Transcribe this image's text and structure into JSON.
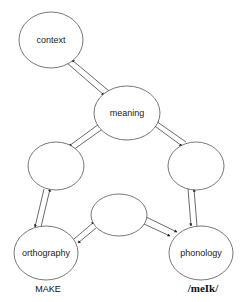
{
  "diagram": {
    "type": "triangle-model-network",
    "nodes": [
      {
        "id": "context",
        "label": "context",
        "cx": 51,
        "cy": 40,
        "rx": 32,
        "ry": 28
      },
      {
        "id": "meaning",
        "label": "meaning",
        "cx": 127,
        "cy": 113,
        "rx": 33,
        "ry": 27
      },
      {
        "id": "hidden_left",
        "label": "",
        "cx": 56,
        "cy": 166,
        "rx": 28,
        "ry": 24
      },
      {
        "id": "hidden_right",
        "label": "",
        "cx": 196,
        "cy": 166,
        "rx": 28,
        "ry": 24
      },
      {
        "id": "hidden_middle",
        "label": "",
        "cx": 119,
        "cy": 215,
        "rx": 28,
        "ry": 21
      },
      {
        "id": "orthography",
        "label": "orthography",
        "cx": 46,
        "cy": 253,
        "rx": 32,
        "ry": 27
      },
      {
        "id": "phonology",
        "label": "phonology",
        "cx": 201,
        "cy": 253,
        "rx": 32,
        "ry": 27
      }
    ],
    "edges": [
      {
        "from": "context",
        "to": "meaning",
        "bidirectional": true
      },
      {
        "from": "meaning",
        "to": "hidden_left",
        "bidirectional": true
      },
      {
        "from": "meaning",
        "to": "hidden_right",
        "bidirectional": true
      },
      {
        "from": "hidden_left",
        "to": "orthography",
        "bidirectional": true
      },
      {
        "from": "hidden_right",
        "to": "phonology",
        "bidirectional": true
      },
      {
        "from": "orthography",
        "to": "hidden_middle",
        "bidirectional": true
      },
      {
        "from": "hidden_middle",
        "to": "phonology",
        "bidirectional": true
      }
    ],
    "captions": {
      "orthography": "MAKE",
      "phonology": "/meIk/"
    }
  }
}
